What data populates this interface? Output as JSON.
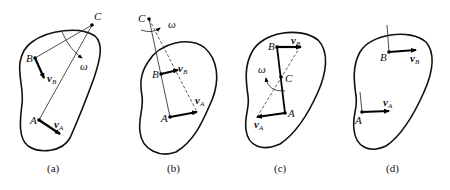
{
  "figure": {
    "panels": [
      {
        "id": "a",
        "caption": "(a)",
        "points": {
          "C": "C",
          "B": "B",
          "A": "A"
        },
        "vectors": {
          "vB": "v",
          "vB_sub": "B",
          "vA": "v",
          "vA_sub": "A"
        },
        "omega": "ω"
      },
      {
        "id": "b",
        "caption": "(b)",
        "points": {
          "C": "C",
          "B": "B",
          "A": "A"
        },
        "vectors": {
          "vB": "v",
          "vB_sub": "B",
          "vA": "v",
          "vA_sub": "A"
        },
        "omega": "ω"
      },
      {
        "id": "c",
        "caption": "(c)",
        "points": {
          "C": "C",
          "B": "B",
          "A": "A"
        },
        "vectors": {
          "vB": "v",
          "vB_sub": "B",
          "vA": "v",
          "vA_sub": "A"
        },
        "omega": "ω"
      },
      {
        "id": "d",
        "caption": "(d)",
        "points": {
          "B": "B",
          "A": "A"
        },
        "vectors": {
          "vB": "v",
          "vB_sub": "B",
          "vA": "v",
          "vA_sub": "A"
        }
      }
    ]
  }
}
